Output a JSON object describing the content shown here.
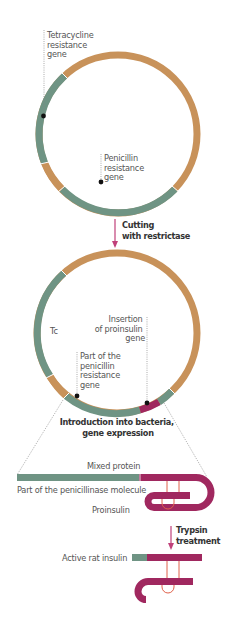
{
  "diagram": {
    "plasmid_original": {
      "labels": {
        "tetracycline": [
          "Tetracycline",
          "resistance",
          "gene"
        ],
        "penicillin": [
          "Penicillin",
          "resistance",
          "gene"
        ]
      }
    },
    "step1": {
      "line1": "Cutting",
      "line2": "with restrictase"
    },
    "plasmid_recombinant": {
      "labels": {
        "tc": "Tc",
        "insertion": [
          "Insertion",
          "of proinsulin",
          "gene"
        ],
        "partial_penicillin": [
          "Part of the",
          "penicillin",
          "resistance",
          "gene"
        ]
      }
    },
    "step2": {
      "line1": "Introduction into bacteria,",
      "line2": "gene expression"
    },
    "protein": {
      "mixed_protein": "Mixed protein",
      "penicillinase_part": "Part of the penicillinase molecule",
      "proinsulin": "Proinsulin"
    },
    "step3": {
      "line1": "Trypsin",
      "line2": "treatment"
    },
    "result": {
      "active_insulin": "Active rat insulin"
    },
    "colors": {
      "green": "#6f9484",
      "orange": "#c8925a",
      "magenta": "#a0285f",
      "arrow": "#c0407a",
      "disulfide": "#e0604a"
    }
  }
}
